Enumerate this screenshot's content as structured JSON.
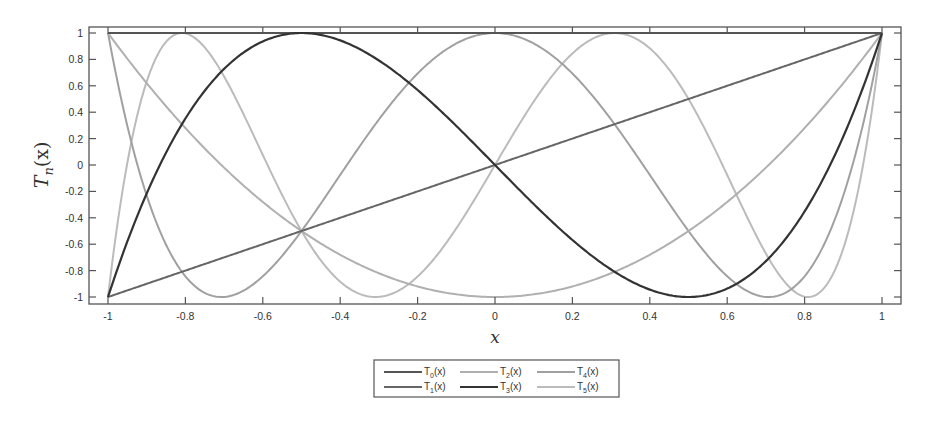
{
  "chart_data": {
    "type": "line",
    "title": "",
    "xlabel": "x",
    "ylabel": "T_n(x)",
    "ylabel_main": "T",
    "ylabel_sub": "n",
    "ylabel_tail": "(x)",
    "xlim": [
      -1,
      1
    ],
    "ylim": [
      -1,
      1
    ],
    "grid": false,
    "legend_position": "below",
    "x_ticks": [
      -1,
      -0.8,
      -0.6,
      -0.4,
      -0.2,
      0,
      0.2,
      0.4,
      0.6,
      0.8,
      1
    ],
    "x_tick_labels": [
      "-1",
      "-0.8",
      "-0.6",
      "-0.4",
      "-0.2",
      "0",
      "0.2",
      "0.4",
      "0.6",
      "0.8",
      "1"
    ],
    "y_ticks": [
      -1,
      -0.8,
      -0.6,
      -0.4,
      -0.2,
      0,
      0.2,
      0.4,
      0.6,
      0.8,
      1
    ],
    "y_tick_labels": [
      "-1",
      "-0.8",
      "-0.6",
      "-0.4",
      "-0.2",
      "0",
      "0.2",
      "0.4",
      "0.6",
      "0.8",
      "1"
    ],
    "series": [
      {
        "name": "T0(x)",
        "label_main": "T",
        "label_sub": "0",
        "label_tail": "(x)",
        "n": 0,
        "color": "#555555",
        "width": 2,
        "formula": "1"
      },
      {
        "name": "T1(x)",
        "label_main": "T",
        "label_sub": "1",
        "label_tail": "(x)",
        "n": 1,
        "color": "#666666",
        "width": 2,
        "formula": "x"
      },
      {
        "name": "T2(x)",
        "label_main": "T",
        "label_sub": "2",
        "label_tail": "(x)",
        "n": 2,
        "color": "#b0b0b0",
        "width": 2,
        "formula": "2x^2-1"
      },
      {
        "name": "T3(x)",
        "label_main": "T",
        "label_sub": "3",
        "label_tail": "(x)",
        "n": 3,
        "color": "#333333",
        "width": 2.2,
        "formula": "4x^3-3x"
      },
      {
        "name": "T4(x)",
        "label_main": "T",
        "label_sub": "4",
        "label_tail": "(x)",
        "n": 4,
        "color": "#a0a0a0",
        "width": 2,
        "formula": "8x^4-8x^2+1"
      },
      {
        "name": "T5(x)",
        "label_main": "T",
        "label_sub": "5",
        "label_tail": "(x)",
        "n": 5,
        "color": "#bbbbbb",
        "width": 2,
        "formula": "16x^5-20x^3+5x"
      }
    ]
  }
}
